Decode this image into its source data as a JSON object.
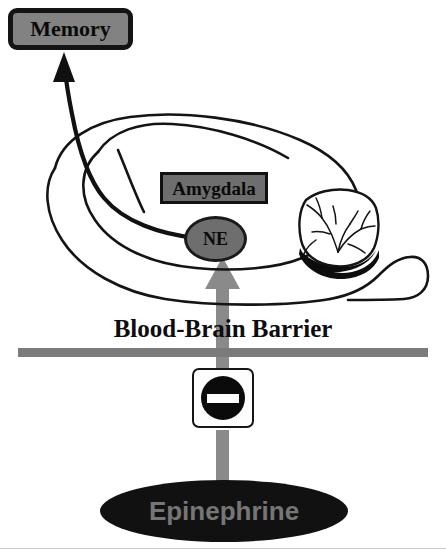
{
  "diagram": {
    "nodes": {
      "memory": {
        "label": "Memory",
        "fill": "#828282",
        "stroke": "#141414",
        "text_color": "#0a0a0a"
      },
      "amygdala": {
        "label": "Amygdala",
        "fill": "#6e6e6e",
        "stroke": "#111111",
        "text_color": "#0a0a0a"
      },
      "ne": {
        "label": "NE",
        "fill": "#6e6e6e",
        "stroke": "#1a1a1a",
        "text_color": "#0a0a0a"
      },
      "epinephrine": {
        "label": "Epinephrine",
        "fill": "#111111",
        "text_color": "#767676"
      }
    },
    "barrier": {
      "label": "Blood-Brain Barrier",
      "bar_color": "#7b7b7b",
      "text_color": "#0d0d0d"
    },
    "blocker": {
      "name": "no-entry-sign",
      "face_color": "#fdfdfd",
      "disc_color": "#0b0b0b",
      "bar_color": "#ffffff"
    },
    "arrows": {
      "ne_to_memory": {
        "color": "#111111",
        "style": "curved-solid-arrow"
      },
      "epinephrine_to_ne": {
        "color": "#8a8a8a",
        "style": "blocked-vertical-arrow"
      }
    },
    "brain": {
      "name": "sagittal-brain-outline",
      "stroke": "#141414",
      "parts": [
        "cerebral-cortex",
        "temporal-lobe-hook",
        "cerebellum",
        "brainstem"
      ]
    }
  }
}
